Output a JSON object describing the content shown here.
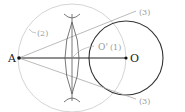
{
  "diagram": {
    "points": {
      "A": {
        "label": "A",
        "x": 19,
        "y": 58
      },
      "O": {
        "label": "O",
        "x": 126,
        "y": 58
      },
      "O_prime": {
        "label": "O'",
        "x": 72,
        "y": 58
      }
    },
    "labels": {
      "step1": "(1)",
      "step2": "(2)",
      "step3_top": "(3)",
      "step3_bottom": "(3)",
      "o_prime_text": "O'",
      "a_text": "A",
      "o_text": "O"
    },
    "colors": {
      "dark": "#333333",
      "gray": "#aaaaaa",
      "light": "#cccccc"
    }
  }
}
